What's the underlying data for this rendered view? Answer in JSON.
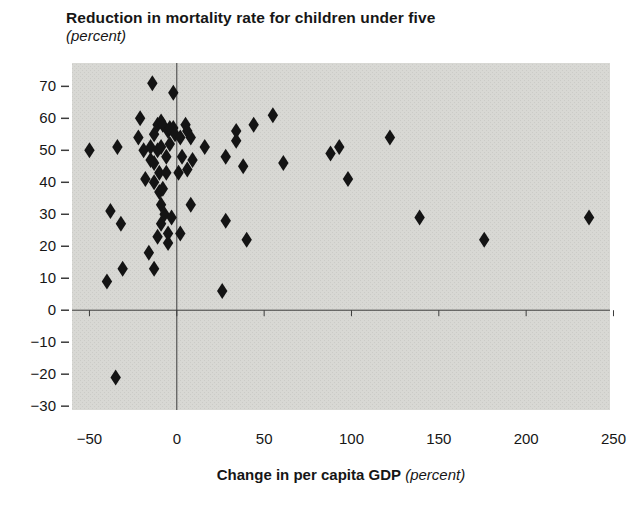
{
  "title": {
    "text": "Reduction in mortality rate for children under five",
    "subtitle": "(percent)"
  },
  "x_axis": {
    "title_bold": "Change in per capita GDP",
    "title_italic": "(percent)"
  },
  "colors": {
    "plot_bg": "#d8d8d4",
    "plot_bg_dot": "#cbcbc7",
    "marker": "#141414",
    "axis_line": "#3c3c3c",
    "tick": "#3c3c3c",
    "text": "#161616"
  },
  "chart_data": {
    "type": "scatter",
    "title": "Reduction in mortality rate for children under five (percent)",
    "xlabel": "Change in per capita GDP (percent)",
    "ylabel": "Reduction in mortality rate for children under five (percent)",
    "legend": "none",
    "grid": false,
    "marker": "diamond",
    "xlim": [
      -60,
      248
    ],
    "ylim": [
      -31.2,
      77.3
    ],
    "x_ticks": [
      -50,
      0,
      50,
      100,
      150,
      200,
      250
    ],
    "y_ticks": [
      -30,
      -20,
      -10,
      0,
      10,
      20,
      30,
      40,
      50,
      60,
      70
    ],
    "points": [
      [
        -50,
        50
      ],
      [
        -34,
        51
      ],
      [
        -38,
        31
      ],
      [
        -32,
        27
      ],
      [
        -31,
        13
      ],
      [
        -40,
        9
      ],
      [
        -35,
        -21
      ],
      [
        -21,
        60
      ],
      [
        -22,
        54
      ],
      [
        -19,
        50
      ],
      [
        -18,
        41
      ],
      [
        -16,
        18
      ],
      [
        -13,
        13
      ],
      [
        -11,
        23
      ],
      [
        -14,
        71
      ],
      [
        -13,
        55
      ],
      [
        -15,
        51
      ],
      [
        -11,
        58
      ],
      [
        -11,
        50
      ],
      [
        -15,
        47
      ],
      [
        -13,
        46
      ],
      [
        -10,
        43
      ],
      [
        -13,
        40
      ],
      [
        -10,
        37
      ],
      [
        -9,
        59
      ],
      [
        -8,
        58
      ],
      [
        -9,
        51
      ],
      [
        -8,
        38
      ],
      [
        -9,
        33
      ],
      [
        -7,
        30
      ],
      [
        -9,
        27
      ],
      [
        -5,
        24
      ],
      [
        -5,
        21
      ],
      [
        -6,
        48
      ],
      [
        -6,
        43
      ],
      [
        -5,
        56
      ],
      [
        -4,
        57
      ],
      [
        -4,
        52
      ],
      [
        -2,
        68
      ],
      [
        -2,
        57
      ],
      [
        -3,
        29
      ],
      [
        -1,
        55
      ],
      [
        1,
        43
      ],
      [
        2,
        54
      ],
      [
        2,
        24
      ],
      [
        3,
        48
      ],
      [
        5,
        58
      ],
      [
        6,
        56
      ],
      [
        6,
        44
      ],
      [
        8,
        54
      ],
      [
        9,
        47
      ],
      [
        8,
        33
      ],
      [
        16,
        51
      ],
      [
        26,
        6
      ],
      [
        28,
        48
      ],
      [
        28,
        28
      ],
      [
        34,
        56
      ],
      [
        34,
        53
      ],
      [
        38,
        45
      ],
      [
        40,
        22
      ],
      [
        44,
        58
      ],
      [
        55,
        61
      ],
      [
        61,
        46
      ],
      [
        88,
        49
      ],
      [
        93,
        51
      ],
      [
        98,
        41
      ],
      [
        122,
        54
      ],
      [
        139,
        29
      ],
      [
        176,
        22
      ],
      [
        236,
        29
      ]
    ]
  }
}
